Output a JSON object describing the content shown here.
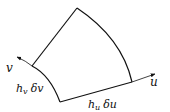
{
  "diagram": {
    "type": "curvilinear-area-element",
    "stroke_color": "#111111",
    "axes": {
      "u": {
        "label": "u"
      },
      "v": {
        "label": "v"
      }
    },
    "edges": {
      "bottom": {
        "label_h": "h",
        "label_sub": "u",
        "label_delta": "δu"
      },
      "left": {
        "label_h": "h",
        "label_sub": "v",
        "label_delta": "δv"
      }
    }
  }
}
